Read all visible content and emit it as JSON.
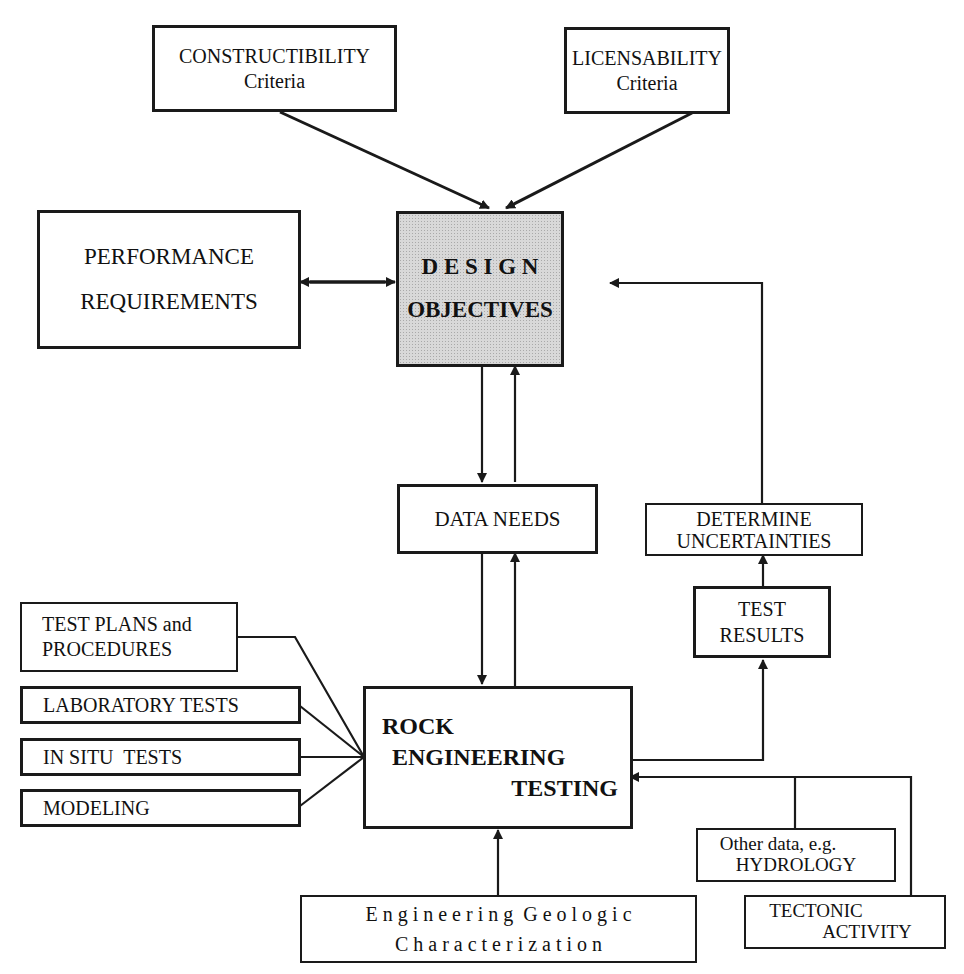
{
  "diagram": {
    "type": "flowchart",
    "nodes": {
      "constructibility": {
        "line1": "CONSTRUCTIBILITY",
        "line2": "Criteria"
      },
      "licensability": {
        "line1": "LICENSABILITY",
        "line2": "Criteria"
      },
      "performance": {
        "line1": "PERFORMANCE",
        "line2": "REQUIREMENTS"
      },
      "design": {
        "line1": "D E S I G N",
        "line2": "OBJECTIVES"
      },
      "data_needs": {
        "line1": "DATA NEEDS"
      },
      "determine": {
        "line1": "DETERMINE",
        "line2": "UNCERTAINTIES"
      },
      "test_results": {
        "line1": "TEST",
        "line2": "RESULTS"
      },
      "test_plans": {
        "line1": "TEST PLANS and",
        "line2": "PROCEDURES"
      },
      "laboratory": {
        "line1": "LABORATORY TESTS"
      },
      "in_situ": {
        "line1": "IN SITU  TESTS"
      },
      "modeling": {
        "line1": "MODELING"
      },
      "rock": {
        "line1": "ROCK",
        "line2": "ENGINEERING",
        "line3": "TESTING"
      },
      "other_data": {
        "line1": "Other data, e.g.",
        "line2": "HYDROLOGY"
      },
      "tectonic": {
        "line1": "TECTONIC",
        "line2": "ACTIVITY"
      },
      "geologic": {
        "line1": "E n g i n e e r i n g  G e o l o g i c",
        "line2": "C h a r a c t e r i z a t i o n"
      }
    },
    "edges": [
      {
        "from": "constructibility",
        "to": "design"
      },
      {
        "from": "licensability",
        "to": "design"
      },
      {
        "from": "performance",
        "to": "design",
        "bidirectional": true
      },
      {
        "from": "design",
        "to": "data_needs"
      },
      {
        "from": "data_needs",
        "to": "design"
      },
      {
        "from": "data_needs",
        "to": "rock"
      },
      {
        "from": "rock",
        "to": "data_needs"
      },
      {
        "from": "test_plans",
        "to": "rock"
      },
      {
        "from": "laboratory",
        "to": "rock"
      },
      {
        "from": "in_situ",
        "to": "rock"
      },
      {
        "from": "modeling",
        "to": "rock"
      },
      {
        "from": "rock",
        "to": "test_results"
      },
      {
        "from": "test_results",
        "to": "determine"
      },
      {
        "from": "determine",
        "to": "design"
      },
      {
        "from": "other_data",
        "to": "rock"
      },
      {
        "from": "tectonic",
        "to": "rock"
      },
      {
        "from": "geologic",
        "to": "rock"
      }
    ],
    "colors": {
      "ink": "#1a1a1a",
      "shade": "#d8d8d8",
      "background": "#ffffff"
    }
  }
}
